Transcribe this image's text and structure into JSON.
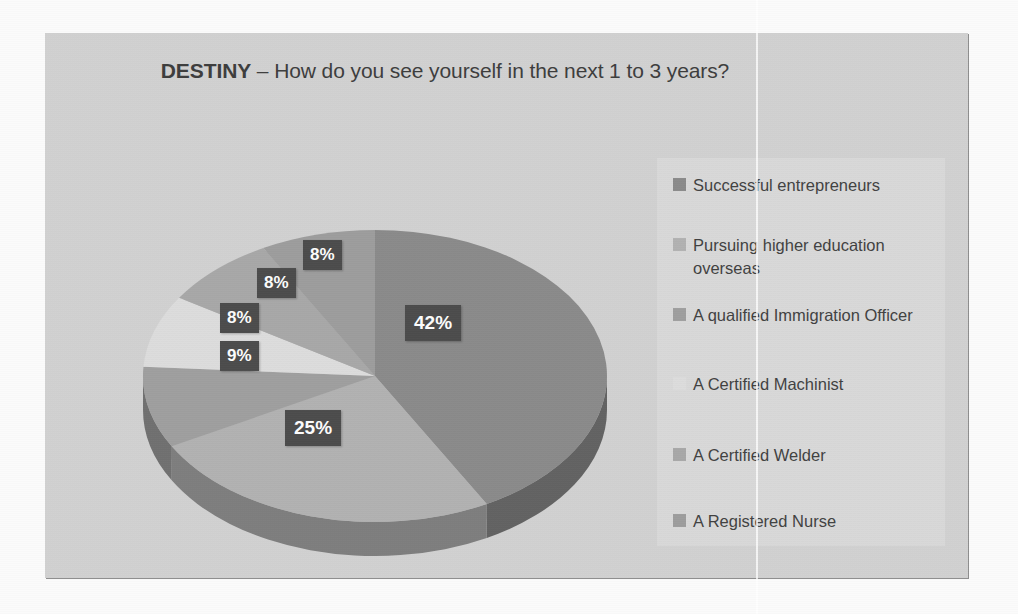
{
  "slide": {
    "title_bold": "DESTINY",
    "title_rest": " – How do you see yourself in the next 1 to 3 years?"
  },
  "colors": {
    "slide_background": "#d2d2d2",
    "legend_background": "#dadada",
    "label_box": "#4a4a4a",
    "label_text": "#ffffff",
    "title_text": "#3b3b3b",
    "legend_text": "#3f3f3f",
    "pie_side": "#757575"
  },
  "chart_data": {
    "type": "pie",
    "title": "DESTINY – How do you see yourself in the next 1 to 3 years?",
    "three_d": true,
    "legend_position": "right",
    "categories": [
      "Successful entrepreneurs",
      "Pursuing higher education overseas",
      " A qualified Immigration Officer",
      "A Certified Machinist",
      "A Certified Welder",
      "A Registered Nurse"
    ],
    "values": [
      42,
      25,
      9,
      8,
      8,
      8
    ],
    "labels": [
      "42%",
      "25%",
      "9%",
      "8%",
      "8%",
      "8%"
    ],
    "slice_colors": [
      "#8a8a8a",
      "#b2b2b2",
      "#9f9f9f",
      "#dedede",
      "#a8a8a8",
      "#9d9d9d"
    ],
    "units": "percent",
    "total": 100
  }
}
